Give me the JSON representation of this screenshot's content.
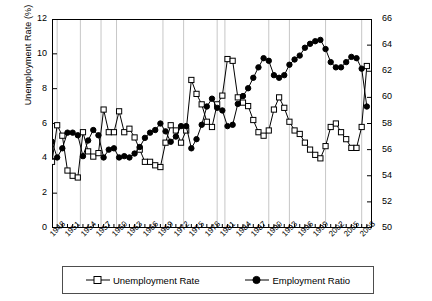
{
  "chart_data": {
    "type": "line",
    "title": "",
    "xlabel": "",
    "ylabel": "Unemployment Rate (%)",
    "ylabel_right": "Employment Ratio (%)",
    "ylim": [
      0,
      12
    ],
    "ylim_right": [
      50,
      66
    ],
    "yticks": [
      "0",
      "2",
      "4",
      "6",
      "8",
      "10",
      "12"
    ],
    "yticks_right": [
      "50",
      "52",
      "54",
      "56",
      "58",
      "60",
      "62",
      "64",
      "66"
    ],
    "xlim": [
      1948,
      2010
    ],
    "grid": "vertical-recession-bands",
    "legend_position": "bottom",
    "x": [
      1948,
      1949,
      1950,
      1951,
      1952,
      1953,
      1954,
      1955,
      1956,
      1957,
      1958,
      1959,
      1960,
      1961,
      1962,
      1963,
      1964,
      1965,
      1966,
      1967,
      1968,
      1969,
      1970,
      1971,
      1972,
      1973,
      1974,
      1975,
      1976,
      1977,
      1978,
      1979,
      1980,
      1981,
      1982,
      1983,
      1984,
      1985,
      1986,
      1987,
      1988,
      1989,
      1990,
      1991,
      1992,
      1993,
      1994,
      1995,
      1996,
      1997,
      1998,
      1999,
      2000,
      2001,
      2002,
      2003,
      2004,
      2005,
      2006,
      2007,
      2008,
      2009
    ],
    "xticks": [
      "1948",
      "1951",
      "1954",
      "1957",
      "1960",
      "1963",
      "1966",
      "1969",
      "1972",
      "1975",
      "1978",
      "1981",
      "1984",
      "1987",
      "1990",
      "1993",
      "1996",
      "1999",
      "2002",
      "2005",
      "2008"
    ],
    "series": [
      {
        "name": "Unemployment Rate",
        "axis": "left",
        "marker": "open-square",
        "color": "#000000",
        "values": [
          3.8,
          5.9,
          5.3,
          3.3,
          3.0,
          2.9,
          5.5,
          4.4,
          4.1,
          4.3,
          6.8,
          5.5,
          5.5,
          6.7,
          5.5,
          5.7,
          5.2,
          4.5,
          3.8,
          3.8,
          3.6,
          3.5,
          4.9,
          5.9,
          5.6,
          4.9,
          5.6,
          8.5,
          7.7,
          7.1,
          6.1,
          5.8,
          7.1,
          7.6,
          9.7,
          9.6,
          7.5,
          7.2,
          7.0,
          6.2,
          5.5,
          5.3,
          5.6,
          6.8,
          7.5,
          6.9,
          6.1,
          5.6,
          5.4,
          4.9,
          4.5,
          4.2,
          4.0,
          4.7,
          5.8,
          6.0,
          5.5,
          5.1,
          4.6,
          4.6,
          5.8,
          9.3
        ]
      },
      {
        "name": "Employment Ratio",
        "axis": "right",
        "marker": "filled-circle",
        "color": "#000000",
        "values": [
          56.6,
          55.4,
          56.1,
          57.3,
          57.3,
          57.1,
          55.5,
          56.7,
          57.5,
          57.1,
          55.4,
          56.0,
          56.1,
          55.4,
          55.5,
          55.4,
          55.7,
          56.2,
          56.9,
          57.3,
          57.5,
          58.0,
          57.4,
          56.6,
          57.0,
          57.8,
          57.8,
          56.1,
          56.8,
          57.9,
          59.3,
          59.9,
          59.2,
          59.0,
          57.8,
          57.9,
          59.5,
          60.1,
          60.7,
          61.5,
          62.3,
          63.0,
          62.8,
          61.7,
          61.5,
          61.7,
          62.5,
          62.9,
          63.2,
          63.8,
          64.1,
          64.3,
          64.4,
          63.7,
          62.7,
          62.3,
          62.3,
          62.7,
          63.1,
          63.0,
          62.2,
          59.3
        ]
      }
    ],
    "recession_bands": [
      1949,
      1953.5,
      1957.5,
      1960.5,
      1969.5,
      1973.5,
      1980,
      1981.5,
      1990,
      1994,
      2001,
      2008
    ]
  },
  "legend": {
    "items": [
      {
        "label": "Unemployment Rate",
        "marker": "open-square-icon"
      },
      {
        "label": "Employment Ratio",
        "marker": "filled-circle-icon"
      }
    ]
  }
}
